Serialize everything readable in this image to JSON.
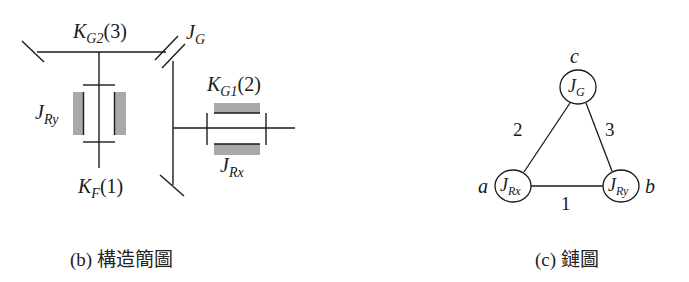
{
  "structure_diagram": {
    "caption": "(b) 構造簡圖",
    "labels": {
      "kg2": {
        "main": "K",
        "sub": "G2",
        "suffix": "(3)"
      },
      "jg": {
        "main": "J",
        "sub": "G"
      },
      "kg1": {
        "main": "K",
        "sub": "G1",
        "suffix": "(2)"
      },
      "jry": {
        "main": "J",
        "sub": "Ry"
      },
      "jrx": {
        "main": "J",
        "sub": "Rx"
      },
      "kf": {
        "main": "K",
        "sub": "F",
        "suffix": "(1)"
      }
    },
    "colors": {
      "line": "#1a1a1a",
      "inertia_fill": "#a9a9a9"
    }
  },
  "chain_diagram": {
    "caption": "(c) 鏈圖",
    "nodes": [
      {
        "id": "c",
        "letter": "c",
        "main": "J",
        "sub": "G"
      },
      {
        "id": "a",
        "letter": "a",
        "main": "J",
        "sub": "Rx"
      },
      {
        "id": "b",
        "letter": "b",
        "main": "J",
        "sub": "Ry"
      }
    ],
    "edges": [
      {
        "from": "a",
        "to": "b",
        "label": "1"
      },
      {
        "from": "a",
        "to": "c",
        "label": "2"
      },
      {
        "from": "b",
        "to": "c",
        "label": "3"
      }
    ]
  }
}
